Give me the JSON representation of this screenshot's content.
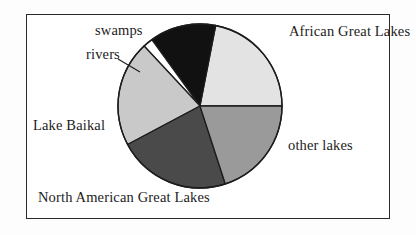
{
  "figure": {
    "frame_color": "#2b2b2b",
    "background": "#ffffff"
  },
  "chart_data": {
    "type": "pie",
    "title": "",
    "subtitle": "",
    "xlabel": "",
    "ylabel": "",
    "legend_position": "none",
    "labels_position": "outside",
    "grid": false,
    "start_angle_deg": 0,
    "direction": "counterclockwise",
    "center": {
      "x": 200,
      "y": 106
    },
    "radius": 82,
    "categories": [
      "African Great Lakes",
      "swamps",
      "rivers",
      "Lake Baikal",
      "North American Great Lakes",
      "other lakes"
    ],
    "values": [
      22,
      13,
      2,
      21,
      22,
      20
    ],
    "slices": [
      {
        "name": "African Great Lakes",
        "label": "African Great Lakes",
        "value": 22,
        "percent": 22,
        "color": "#e3e3e3",
        "stroke": "#1c1c1c",
        "start_deg": 0,
        "end_deg": 79
      },
      {
        "name": "swamps",
        "label": "swamps",
        "value": 13,
        "percent": 13,
        "color": "#111111",
        "stroke": "#1c1c1c",
        "start_deg": 79,
        "end_deg": 126
      },
      {
        "name": "rivers",
        "label": "rivers",
        "value": 2,
        "percent": 2,
        "color": "#ffffff",
        "stroke": "#1c1c1c",
        "start_deg": 126,
        "end_deg": 133
      },
      {
        "name": "Lake Baikal",
        "label": "Lake Baikal",
        "value": 21,
        "percent": 21,
        "color": "#c9c9c9",
        "stroke": "#1c1c1c",
        "start_deg": 133,
        "end_deg": 208
      },
      {
        "name": "North American Great Lakes",
        "label": "North American Great Lakes",
        "value": 22,
        "percent": 22,
        "color": "#4a4a4a",
        "stroke": "#1c1c1c",
        "start_deg": 208,
        "end_deg": 288
      },
      {
        "name": "other lakes",
        "label": "other lakes",
        "value": 20,
        "percent": 20,
        "color": "#9a9a9a",
        "stroke": "#1c1c1c",
        "start_deg": 288,
        "end_deg": 360
      }
    ]
  },
  "labels": {
    "african_great_lakes": "African Great Lakes",
    "other_lakes": "other lakes",
    "north_american_great_lakes": "North American Great Lakes",
    "lake_baikal": "Lake Baikal",
    "swamps": "swamps",
    "rivers": "rivers"
  }
}
